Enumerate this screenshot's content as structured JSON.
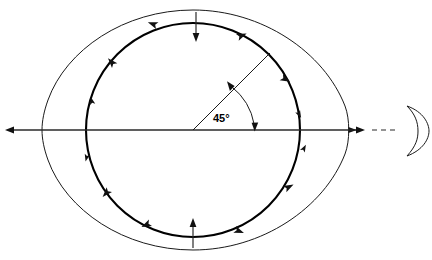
{
  "diagram": {
    "angle_label": "45°",
    "colors": {
      "line": "#1a1a1a",
      "thick_line": "#000000",
      "axis": "#2a2a2a",
      "background": "#ffffff"
    },
    "center": {
      "x": 193,
      "y": 130
    },
    "earth_circle": {
      "name": "inner-circle",
      "radius": 107,
      "stroke_width": 2.1,
      "flow_arrow_count": 12,
      "flow_description": "arrowheads converging toward left and right bulges"
    },
    "tidal_envelope": {
      "name": "outer-oval",
      "left_x": 42,
      "right_x": 348,
      "top_y": 10,
      "bottom_y": 250,
      "stroke_width": 1
    },
    "axis": {
      "y": 130,
      "left_tip_x": 5,
      "right_tip_x": 363,
      "dash_start_x": 372,
      "dash_end_x": 398
    },
    "radius_line": {
      "name": "angle-radius",
      "angle_degrees": 45,
      "from": {
        "x": 193,
        "y": 130
      },
      "to": {
        "x": 269,
        "y": 54
      }
    },
    "angle_arc": {
      "radius": 62,
      "double_headed": true
    },
    "vertical_arrows": [
      {
        "name": "top-compression-arrow",
        "x": 196,
        "y_start": 12,
        "y_end": 40,
        "direction": "down"
      },
      {
        "name": "bottom-compression-arrow",
        "x": 193,
        "y_start": 248,
        "y_end": 220,
        "direction": "up"
      }
    ],
    "moon": {
      "name": "crescent-moon",
      "center_x": 413,
      "center_y": 130,
      "radius": 24,
      "opening": "left"
    }
  }
}
